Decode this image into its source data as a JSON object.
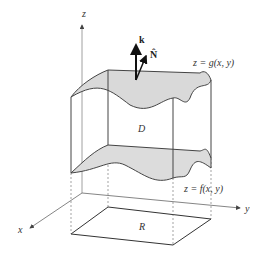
{
  "diagram": {
    "axes": {
      "z_label": "z",
      "y_label": "y",
      "x_label": "x"
    },
    "vectors": {
      "k_label": "k",
      "normal_label": "N̂"
    },
    "surfaces": {
      "top_label": "z = g(x, y)",
      "bottom_label": "z = f(x, y)"
    },
    "region_labels": {
      "solid": "D",
      "base": "R"
    },
    "colors": {
      "surface_fill": "#d9d9d9",
      "stroke": "#444444",
      "axis": "#666666"
    }
  }
}
